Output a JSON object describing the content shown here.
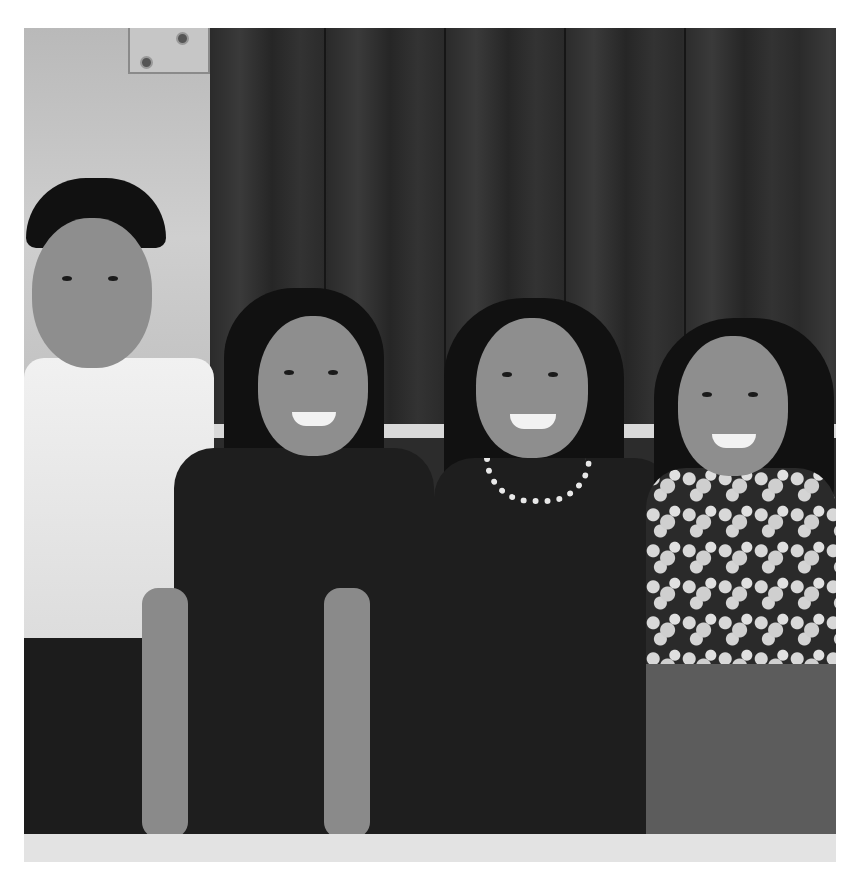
{
  "image": {
    "description": "Black and white photograph of four smiling people standing in front of a dark wooden door",
    "subjects": [
      {
        "role": "man",
        "clothing": "white shirt, dark trousers",
        "position": "left"
      },
      {
        "role": "woman",
        "clothing": "dark short-sleeved dress, long dark hair",
        "position": "center-left"
      },
      {
        "role": "woman",
        "clothing": "dark dress with jeweled necklace",
        "position": "center-right"
      },
      {
        "role": "woman",
        "clothing": "floral patterned top",
        "position": "right"
      }
    ],
    "background": "dark wooden plank door with hinge plate on light wall",
    "colors": {
      "frame": "#ffffff",
      "door": "#2b2b2b",
      "wall": "#c4c4c4",
      "rail": "#d9d9d9"
    }
  }
}
